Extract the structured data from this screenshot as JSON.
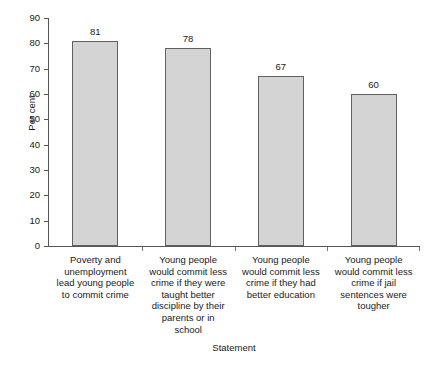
{
  "chart_data": {
    "type": "bar",
    "title": "",
    "subtitle": "",
    "xlabel": "Statement",
    "ylabel": "Per cent",
    "ylim": [
      0,
      90
    ],
    "yticks": [
      0,
      10,
      20,
      30,
      40,
      50,
      60,
      70,
      80,
      90
    ],
    "grid": false,
    "legend": false,
    "legend_position": "none",
    "orientation": "vertical",
    "categories": [
      "Poverty and unemployment lead young people to commit crime",
      "Young people would commit less crime if they were taught better discipline by their parents or in school",
      "Young people would commit less crime if they had better education",
      "Young people would commit less crime if jail sentences were tougher"
    ],
    "values": [
      81,
      78,
      67,
      60
    ],
    "value_labels": [
      "81",
      "78",
      "67",
      "60"
    ],
    "bar_fill_color": "#d4d4d4",
    "bar_border_color": "#606060",
    "axis_color": "#555555",
    "text_color": "#1a1a1a",
    "background_color": "#ffffff"
  },
  "axes": {
    "y_tick_labels": [
      "0",
      "10",
      "20",
      "30",
      "40",
      "50",
      "60",
      "70",
      "80",
      "90"
    ],
    "y_axis_title": "Per cent",
    "x_axis_title": "Statement"
  },
  "bars": [
    {
      "value_label": "81",
      "category_lines": [
        "Poverty and",
        "unemployment",
        "lead young people",
        "to commit crime"
      ]
    },
    {
      "value_label": "78",
      "category_lines": [
        "Young people",
        "would commit less",
        "crime if they were",
        "taught better",
        "discipline by their",
        "parents or in",
        "school"
      ]
    },
    {
      "value_label": "67",
      "category_lines": [
        "Young people",
        "would commit less",
        "crime if they had",
        "better education"
      ]
    },
    {
      "value_label": "60",
      "category_lines": [
        "Young people",
        "would commit less",
        "crime if jail",
        "sentences were",
        "tougher"
      ]
    }
  ]
}
